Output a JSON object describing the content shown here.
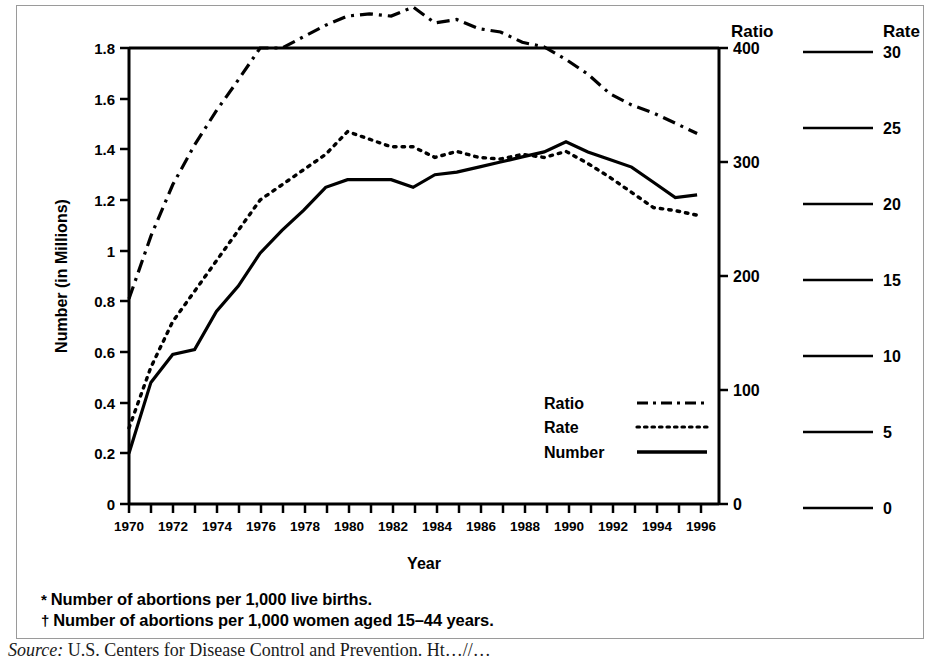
{
  "figure": {
    "y_axis_title": "Number (in Millions)",
    "x_axis_title": "Year",
    "ratio_scale_header": "Ratio",
    "rate_scale_header": "Rate",
    "footnote_1_marker": "*",
    "footnote_1": "Number of abortions per 1,000 live births.",
    "footnote_2_marker": "†",
    "footnote_2": "Number of abortions per 1,000 women aged 15–44 years.",
    "source_label": "Source:",
    "source_text": " U.S. Centers for Disease Control and Prevention. Ht…//…"
  },
  "legend": {
    "items": [
      {
        "label": "Ratio",
        "style": "dash-dot"
      },
      {
        "label": "Rate",
        "style": "dotted"
      },
      {
        "label": "Number",
        "style": "solid"
      }
    ]
  },
  "chart_data": {
    "type": "line",
    "title": "",
    "xlabel": "Year",
    "ylabel": "Number (in Millions)",
    "grid": false,
    "legend_position": "inside-lower-right",
    "x": [
      1970,
      1971,
      1972,
      1973,
      1974,
      1975,
      1976,
      1977,
      1978,
      1979,
      1980,
      1981,
      1982,
      1983,
      1984,
      1985,
      1986,
      1987,
      1988,
      1989,
      1990,
      1991,
      1992,
      1993,
      1994,
      1995,
      1996
    ],
    "xlim": [
      1970,
      1997
    ],
    "xticks_major": [
      1970,
      1972,
      1974,
      1976,
      1978,
      1980,
      1982,
      1984,
      1986,
      1988,
      1990,
      1992,
      1994,
      1996
    ],
    "xticks_minor_step": 1,
    "axes": [
      {
        "name": "left",
        "label": "Number (in Millions)",
        "ticks": [
          "0",
          "0.2",
          "0.4",
          "0.6",
          "0.8",
          "1",
          "1.2",
          "1.4",
          "1.6",
          "1.8"
        ],
        "lim": [
          0,
          1.8
        ]
      },
      {
        "name": "right",
        "label": "Ratio",
        "ticks": [
          "0",
          "100",
          "200",
          "300",
          "400"
        ],
        "lim": [
          0,
          400
        ]
      },
      {
        "name": "far-right",
        "label": "Rate",
        "ticks": [
          "0",
          "5",
          "10",
          "15",
          "20",
          "25",
          "30"
        ],
        "lim": [
          0,
          30
        ]
      }
    ],
    "series": [
      {
        "name": "Ratio",
        "style": "dash-dot",
        "axis": "right",
        "unit": "abortions per 1,000 live births",
        "values": [
          180,
          235,
          280,
          315,
          345,
          372,
          400,
          400,
          410,
          420,
          428,
          430,
          428,
          436,
          422,
          425,
          417,
          414,
          405,
          401,
          390,
          377,
          360,
          350,
          343,
          334,
          325
        ]
      },
      {
        "name": "Rate",
        "style": "dotted",
        "axis": "far-right",
        "unit": "abortions per 1,000 women aged 15-44 years",
        "values": [
          5.0,
          9.0,
          12.0,
          14.0,
          16.0,
          18.0,
          20.0,
          21.0,
          22.0,
          23.0,
          24.5,
          24.0,
          23.5,
          23.5,
          22.8,
          23.2,
          22.8,
          22.7,
          23.0,
          22.8,
          23.2,
          22.4,
          21.5,
          20.5,
          19.5,
          19.3,
          19.0
        ]
      },
      {
        "name": "Number",
        "style": "solid",
        "axis": "left",
        "unit": "millions of abortions",
        "values": [
          0.2,
          0.48,
          0.59,
          0.61,
          0.76,
          0.86,
          0.99,
          1.08,
          1.16,
          1.25,
          1.28,
          1.28,
          1.28,
          1.25,
          1.3,
          1.31,
          1.33,
          1.35,
          1.37,
          1.39,
          1.43,
          1.39,
          1.36,
          1.33,
          1.27,
          1.21,
          1.22
        ]
      }
    ]
  },
  "scale_legend": {
    "ratio_ticks": [
      {
        "value": "400",
        "y_frac": 1.0
      },
      {
        "value": "300",
        "y_frac": 0.75
      },
      {
        "value": "200",
        "y_frac": 0.5
      },
      {
        "value": "100",
        "y_frac": 0.25
      },
      {
        "value": "0",
        "y_frac": 0.0
      }
    ],
    "rate_ticks": [
      {
        "value": "30",
        "y_frac": 1.0
      },
      {
        "value": "25",
        "y_frac": 0.833
      },
      {
        "value": "20",
        "y_frac": 0.667
      },
      {
        "value": "15",
        "y_frac": 0.5
      },
      {
        "value": "10",
        "y_frac": 0.333
      },
      {
        "value": "5",
        "y_frac": 0.167
      },
      {
        "value": "0",
        "y_frac": 0.0
      }
    ]
  }
}
